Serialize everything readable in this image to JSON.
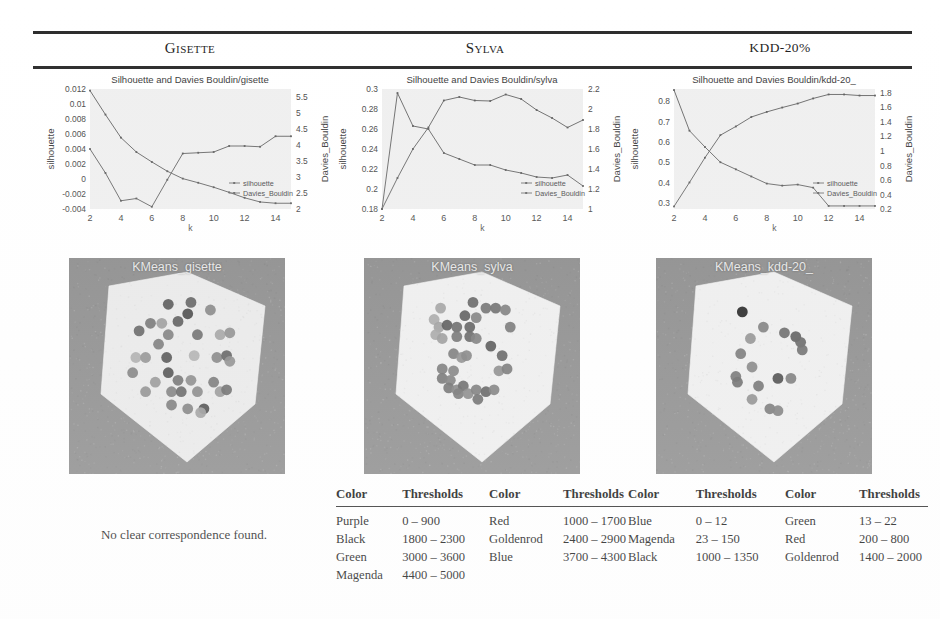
{
  "figure": {
    "columns": [
      {
        "id": "gisette",
        "header": "Gisette",
        "chart_title": "Silhouette and Davies Bouldin/gisette",
        "cluster_caption": "KMeans_gisette",
        "note": "No clear correspondence found.",
        "has_table": false
      },
      {
        "id": "sylva",
        "header": "Sylva",
        "chart_title": "Silhouette and Davies Bouldin/sylva",
        "cluster_caption": "KMeans_sylva",
        "has_table": true
      },
      {
        "id": "kdd20",
        "header": "KDD-20%",
        "chart_title": "Silhouette and Davies Bouldin/kdd-20_",
        "cluster_caption": "KMeans_kdd-20_",
        "has_table": true
      }
    ],
    "legend_labels": [
      "silhouette",
      "Davies_Bouldin"
    ],
    "axis_labels": {
      "x": "k",
      "y_left": "silhouette",
      "y_right": "Davies_Bouldin"
    }
  },
  "tables": {
    "headers": [
      "Color",
      "Thresholds",
      "Color",
      "Thresholds"
    ],
    "sylva": {
      "rows": [
        {
          "color1": "Purple",
          "thr1": "0 – 900",
          "color2": "Red",
          "thr2": "1000 – 1700"
        },
        {
          "color1": "Black",
          "thr1": "1800 – 2300",
          "color2": "Goldenrod",
          "thr2": "2400 – 2900"
        },
        {
          "color1": "Green",
          "thr1": "3000 – 3600",
          "color2": "Blue",
          "thr2": "3700 – 4300"
        },
        {
          "color1": "Magenda",
          "thr1": "4400 – 5000",
          "color2": "",
          "thr2": ""
        }
      ]
    },
    "kdd20": {
      "rows": [
        {
          "color1": "Blue",
          "thr1": "0 – 12",
          "color2": "Green",
          "thr2": "13 – 22"
        },
        {
          "color1": "Magenda",
          "thr1": "23 – 150",
          "color2": "Red",
          "thr2": "200 – 800"
        },
        {
          "color1": "Black",
          "thr1": "1000 – 1350",
          "color2": "Goldenrod",
          "thr2": "1400 – 2000"
        }
      ]
    }
  },
  "chart_data": [
    {
      "id": "gisette",
      "type": "line",
      "title": "Silhouette and Davies Bouldin/gisette",
      "xlabel": "k",
      "ylabel": "silhouette",
      "y2label": "Davies_Bouldin",
      "x": [
        2,
        3,
        4,
        5,
        6,
        7,
        8,
        9,
        10,
        11,
        12,
        13,
        14,
        15
      ],
      "xlim": [
        2,
        15
      ],
      "xticks": [
        2,
        4,
        6,
        8,
        10,
        12,
        14
      ],
      "ylim": [
        -0.004,
        0.012
      ],
      "yticks": [
        -0.004,
        -0.002,
        0,
        0.002,
        0.004,
        0.006,
        0.008,
        0.01,
        0.012
      ],
      "y2lim": [
        2,
        5.75
      ],
      "y2ticks": [
        2,
        2.5,
        3,
        3.5,
        4,
        4.5,
        5,
        5.5
      ],
      "grid": false,
      "legend_position": "lower-right",
      "series": [
        {
          "name": "silhouette",
          "axis": "left",
          "values": [
            0.004,
            0.0008,
            -0.0029,
            -0.0026,
            -0.0037,
            -0.0001,
            0.0034,
            0.0035,
            0.0036,
            0.0044,
            0.0044,
            0.0043,
            0.0057,
            0.0057
          ]
        },
        {
          "name": "Davies_Bouldin",
          "axis": "right",
          "values": [
            5.7,
            4.95,
            4.23,
            3.78,
            3.47,
            3.18,
            2.95,
            2.82,
            2.68,
            2.52,
            2.35,
            2.22,
            2.18,
            2.18
          ]
        }
      ]
    },
    {
      "id": "sylva",
      "type": "line",
      "title": "Silhouette and Davies Bouldin/sylva",
      "xlabel": "k",
      "ylabel": "silhouette",
      "y2label": "Davies_Bouldin",
      "x": [
        2,
        3,
        4,
        5,
        6,
        7,
        8,
        9,
        10,
        11,
        12,
        13,
        14,
        15
      ],
      "xlim": [
        2,
        15
      ],
      "xticks": [
        2,
        4,
        6,
        8,
        10,
        12,
        14
      ],
      "ylim": [
        0.18,
        0.3
      ],
      "yticks": [
        0.18,
        0.2,
        0.22,
        0.24,
        0.26,
        0.28,
        0.3
      ],
      "y2lim": [
        1.0,
        2.2
      ],
      "y2ticks": [
        1,
        1.2,
        1.4,
        1.6,
        1.8,
        2.0,
        2.2
      ],
      "grid": false,
      "legend_position": "lower-right",
      "series": [
        {
          "name": "silhouette",
          "axis": "left",
          "values": [
            0.18,
            0.211,
            0.24,
            0.2615,
            0.2885,
            0.292,
            0.2885,
            0.288,
            0.2945,
            0.29,
            0.279,
            0.271,
            0.2615,
            0.269
          ]
        },
        {
          "name": "Davies_Bouldin",
          "axis": "right",
          "values": [
            1.0,
            2.16,
            1.83,
            1.8,
            1.56,
            1.5,
            1.44,
            1.44,
            1.39,
            1.36,
            1.32,
            1.31,
            1.34,
            1.23
          ]
        }
      ]
    },
    {
      "id": "kdd20",
      "type": "line",
      "title": "Silhouette and Davies Bouldin/kdd-20_",
      "xlabel": "k",
      "ylabel": "silhouette",
      "y2label": "Davies_Bouldin",
      "x": [
        2,
        3,
        4,
        5,
        6,
        7,
        8,
        9,
        10,
        11,
        12,
        13,
        14,
        15
      ],
      "xlim": [
        2,
        15
      ],
      "xticks": [
        2,
        4,
        6,
        8,
        10,
        12,
        14
      ],
      "ylim": [
        0.27,
        0.86
      ],
      "yticks": [
        0.3,
        0.4,
        0.5,
        0.6,
        0.7,
        0.8
      ],
      "y2lim": [
        0.2,
        1.85
      ],
      "y2ticks": [
        0.2,
        0.4,
        0.6,
        0.8,
        1.0,
        1.2,
        1.4,
        1.6,
        1.8
      ],
      "grid": false,
      "legend_position": "lower-right",
      "series": [
        {
          "name": "silhouette",
          "axis": "left",
          "values": [
            0.855,
            0.655,
            0.575,
            0.5,
            0.465,
            0.43,
            0.395,
            0.385,
            0.39,
            0.375,
            0.285,
            0.285,
            0.285,
            0.285
          ]
        },
        {
          "name": "Davies_Bouldin",
          "axis": "right",
          "values": [
            0.235,
            0.565,
            0.905,
            1.215,
            1.335,
            1.465,
            1.535,
            1.595,
            1.65,
            1.72,
            1.775,
            1.775,
            1.76,
            1.76
          ]
        }
      ]
    }
  ],
  "cluster_plots": [
    {
      "id": "gisette",
      "caption": "KMeans_gisette",
      "background": "#8a8a8a",
      "surface": "#e9e9e9",
      "points": [
        {
          "x": 0.44,
          "y": 0.17,
          "s": 0.63
        },
        {
          "x": 0.58,
          "y": 0.16,
          "s": 0.57
        },
        {
          "x": 0.7,
          "y": 0.2,
          "s": 0.35
        },
        {
          "x": 0.56,
          "y": 0.22,
          "s": 0.72
        },
        {
          "x": 0.33,
          "y": 0.27,
          "s": 0.45
        },
        {
          "x": 0.4,
          "y": 0.27,
          "s": 0.22
        },
        {
          "x": 0.5,
          "y": 0.26,
          "s": 0.6
        },
        {
          "x": 0.26,
          "y": 0.31,
          "s": 0.55
        },
        {
          "x": 0.44,
          "y": 0.33,
          "s": 0.4
        },
        {
          "x": 0.62,
          "y": 0.33,
          "s": 0.5
        },
        {
          "x": 0.76,
          "y": 0.33,
          "s": 0.18
        },
        {
          "x": 0.82,
          "y": 0.32,
          "s": 0.3
        },
        {
          "x": 0.38,
          "y": 0.38,
          "s": 0.42
        },
        {
          "x": 0.24,
          "y": 0.45,
          "s": 0.12
        },
        {
          "x": 0.3,
          "y": 0.45,
          "s": 0.28
        },
        {
          "x": 0.43,
          "y": 0.45,
          "s": 0.66
        },
        {
          "x": 0.6,
          "y": 0.44,
          "s": 0.1
        },
        {
          "x": 0.74,
          "y": 0.45,
          "s": 0.36
        },
        {
          "x": 0.8,
          "y": 0.44,
          "s": 0.58
        },
        {
          "x": 0.82,
          "y": 0.47,
          "s": 0.3
        },
        {
          "x": 0.22,
          "y": 0.53,
          "s": 0.38
        },
        {
          "x": 0.44,
          "y": 0.53,
          "s": 0.68
        },
        {
          "x": 0.36,
          "y": 0.58,
          "s": 0.26
        },
        {
          "x": 0.5,
          "y": 0.57,
          "s": 0.48
        },
        {
          "x": 0.58,
          "y": 0.57,
          "s": 0.33
        },
        {
          "x": 0.72,
          "y": 0.58,
          "s": 0.44
        },
        {
          "x": 0.3,
          "y": 0.63,
          "s": 0.3
        },
        {
          "x": 0.46,
          "y": 0.63,
          "s": 0.4
        },
        {
          "x": 0.52,
          "y": 0.63,
          "s": 0.55
        },
        {
          "x": 0.62,
          "y": 0.63,
          "s": 0.35
        },
        {
          "x": 0.76,
          "y": 0.63,
          "s": 0.25
        },
        {
          "x": 0.8,
          "y": 0.62,
          "s": 0.5
        },
        {
          "x": 0.46,
          "y": 0.7,
          "s": 0.42
        },
        {
          "x": 0.56,
          "y": 0.72,
          "s": 0.38
        },
        {
          "x": 0.66,
          "y": 0.72,
          "s": 0.7
        },
        {
          "x": 0.64,
          "y": 0.74,
          "s": 0.2
        }
      ]
    },
    {
      "id": "sylva",
      "caption": "KMeans_sylva",
      "background": "#8a8a8a",
      "surface": "#eeeeee",
      "points": [
        {
          "x": 0.5,
          "y": 0.16,
          "s": 0.55
        },
        {
          "x": 0.58,
          "y": 0.19,
          "s": 0.48
        },
        {
          "x": 0.64,
          "y": 0.19,
          "s": 0.5
        },
        {
          "x": 0.7,
          "y": 0.2,
          "s": 0.4
        },
        {
          "x": 0.3,
          "y": 0.19,
          "s": 0.18
        },
        {
          "x": 0.45,
          "y": 0.23,
          "s": 0.6
        },
        {
          "x": 0.52,
          "y": 0.24,
          "s": 0.38
        },
        {
          "x": 0.26,
          "y": 0.25,
          "s": 0.14
        },
        {
          "x": 0.29,
          "y": 0.29,
          "s": 0.2
        },
        {
          "x": 0.34,
          "y": 0.28,
          "s": 0.62
        },
        {
          "x": 0.4,
          "y": 0.29,
          "s": 0.52
        },
        {
          "x": 0.48,
          "y": 0.29,
          "s": 0.58
        },
        {
          "x": 0.73,
          "y": 0.29,
          "s": 0.44
        },
        {
          "x": 0.27,
          "y": 0.33,
          "s": 0.16
        },
        {
          "x": 0.31,
          "y": 0.35,
          "s": 0.22
        },
        {
          "x": 0.4,
          "y": 0.34,
          "s": 0.46
        },
        {
          "x": 0.48,
          "y": 0.34,
          "s": 0.54
        },
        {
          "x": 0.52,
          "y": 0.35,
          "s": 0.4
        },
        {
          "x": 0.61,
          "y": 0.39,
          "s": 0.64
        },
        {
          "x": 0.38,
          "y": 0.43,
          "s": 0.42
        },
        {
          "x": 0.43,
          "y": 0.45,
          "s": 0.3
        },
        {
          "x": 0.46,
          "y": 0.44,
          "s": 0.36
        },
        {
          "x": 0.68,
          "y": 0.44,
          "s": 0.56
        },
        {
          "x": 0.31,
          "y": 0.51,
          "s": 0.42
        },
        {
          "x": 0.38,
          "y": 0.52,
          "s": 0.38
        },
        {
          "x": 0.66,
          "y": 0.52,
          "s": 0.32
        },
        {
          "x": 0.71,
          "y": 0.51,
          "s": 0.44
        },
        {
          "x": 0.31,
          "y": 0.56,
          "s": 0.46
        },
        {
          "x": 0.36,
          "y": 0.57,
          "s": 0.4
        },
        {
          "x": 0.35,
          "y": 0.61,
          "s": 0.48
        },
        {
          "x": 0.4,
          "y": 0.62,
          "s": 0.36
        },
        {
          "x": 0.44,
          "y": 0.6,
          "s": 0.52
        },
        {
          "x": 0.41,
          "y": 0.64,
          "s": 0.44
        },
        {
          "x": 0.47,
          "y": 0.64,
          "s": 0.34
        },
        {
          "x": 0.52,
          "y": 0.62,
          "s": 0.42
        },
        {
          "x": 0.58,
          "y": 0.63,
          "s": 0.58
        },
        {
          "x": 0.63,
          "y": 0.62,
          "s": 0.4
        },
        {
          "x": 0.53,
          "y": 0.67,
          "s": 0.5
        }
      ]
    },
    {
      "id": "kdd20",
      "caption": "KMeans_kdd-20_",
      "background": "#8a8a8a",
      "surface": "#eeeeee",
      "points": [
        {
          "x": 0.36,
          "y": 0.21,
          "s": 0.95
        },
        {
          "x": 0.49,
          "y": 0.29,
          "s": 0.4
        },
        {
          "x": 0.41,
          "y": 0.35,
          "s": 0.28
        },
        {
          "x": 0.62,
          "y": 0.32,
          "s": 0.52
        },
        {
          "x": 0.69,
          "y": 0.34,
          "s": 0.6
        },
        {
          "x": 0.72,
          "y": 0.37,
          "s": 0.55
        },
        {
          "x": 0.73,
          "y": 0.41,
          "s": 0.5
        },
        {
          "x": 0.35,
          "y": 0.43,
          "s": 0.44
        },
        {
          "x": 0.42,
          "y": 0.5,
          "s": 0.36
        },
        {
          "x": 0.32,
          "y": 0.55,
          "s": 0.46
        },
        {
          "x": 0.33,
          "y": 0.58,
          "s": 0.5
        },
        {
          "x": 0.58,
          "y": 0.56,
          "s": 0.72
        },
        {
          "x": 0.66,
          "y": 0.56,
          "s": 0.42
        },
        {
          "x": 0.46,
          "y": 0.6,
          "s": 0.48
        },
        {
          "x": 0.42,
          "y": 0.67,
          "s": 0.3
        },
        {
          "x": 0.53,
          "y": 0.72,
          "s": 0.44
        },
        {
          "x": 0.58,
          "y": 0.73,
          "s": 0.4
        }
      ]
    }
  ]
}
